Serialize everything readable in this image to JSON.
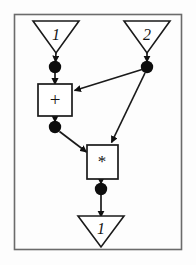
{
  "diagram": {
    "frame": {
      "stroke_color": "#6b6b6b",
      "fill_color": "#fdfdfd",
      "x": 14,
      "y": 14,
      "width": 168,
      "height": 236
    },
    "style": {
      "line_color": "#1a1a1a",
      "node_fill": "#0d0d0d",
      "box_fill": "#ffffff",
      "box_stroke": "#1a1a1a",
      "triangle_fill": "#ffffff",
      "triangle_stroke": "#1a1a1a"
    },
    "input_ports": [
      {
        "id": "in1",
        "label": "1",
        "cx": 56,
        "cy": 32
      },
      {
        "id": "in2",
        "label": "2",
        "cx": 147,
        "cy": 32
      }
    ],
    "output_ports": [
      {
        "id": "out1",
        "label": "1",
        "cx": 101,
        "cy": 227
      }
    ],
    "operators": [
      {
        "id": "add",
        "label": "+",
        "x": 38,
        "y": 84,
        "width": 34,
        "height": 32
      },
      {
        "id": "mul",
        "label": "*",
        "x": 87,
        "y": 145,
        "width": 31,
        "height": 34
      }
    ],
    "tokens": [
      {
        "id": "tok-in1",
        "cx": 55,
        "cy": 67,
        "r": 6
      },
      {
        "id": "tok-in2",
        "cx": 147,
        "cy": 67,
        "r": 6
      },
      {
        "id": "tok-add-out",
        "cx": 55,
        "cy": 127,
        "r": 6
      },
      {
        "id": "tok-mul-out",
        "cx": 101,
        "cy": 189,
        "r": 6
      }
    ],
    "edges": [
      {
        "id": "edge-in1-to-tok",
        "from": "in1",
        "to": "tok-in1",
        "x1": 56,
        "y1": 52,
        "x2": 55,
        "y2": 61
      },
      {
        "id": "edge-tok-to-add",
        "from": "tok-in1",
        "to": "add",
        "x1": 55,
        "y1": 73,
        "x2": 55,
        "y2": 84
      },
      {
        "id": "edge-in2-to-tok",
        "from": "in2",
        "to": "tok-in2",
        "x1": 147,
        "y1": 52,
        "x2": 147,
        "y2": 61
      },
      {
        "id": "edge-tok2-to-add",
        "from": "tok-in2",
        "to": "add",
        "x1": 142,
        "y1": 70,
        "x2": 74,
        "y2": 91
      },
      {
        "id": "edge-tok2-to-mul",
        "from": "tok-in2",
        "to": "mul",
        "x1": 145,
        "y1": 73,
        "x2": 112,
        "y2": 142
      },
      {
        "id": "edge-add-to-tok",
        "from": "add",
        "to": "tok-add-out",
        "x1": 55,
        "y1": 116,
        "x2": 55,
        "y2": 121
      },
      {
        "id": "edge-tok-add-to-mul",
        "from": "tok-add-out",
        "to": "mul",
        "x1": 60,
        "y1": 131,
        "x2": 86,
        "y2": 152
      },
      {
        "id": "edge-mul-to-tok",
        "from": "mul",
        "to": "tok-mul-out",
        "x1": 101,
        "y1": 179,
        "x2": 101,
        "y2": 183
      },
      {
        "id": "edge-tok-mul-to-out",
        "from": "tok-mul-out",
        "to": "out1",
        "x1": 101,
        "y1": 195,
        "x2": 101,
        "y2": 216
      }
    ]
  }
}
